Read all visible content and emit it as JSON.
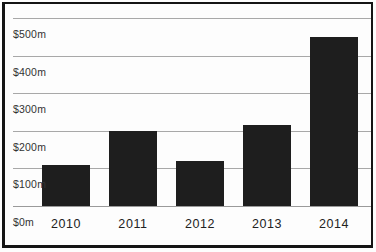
{
  "chart_data": {
    "type": "bar",
    "title": "",
    "xlabel": "",
    "ylabel": "",
    "unit": "$m (millions of dollars)",
    "categories": [
      "2010",
      "2011",
      "2012",
      "2013",
      "2014"
    ],
    "values": [
      110,
      200,
      120,
      215,
      450
    ],
    "ylim": [
      0,
      550
    ],
    "y_ticks": [
      {
        "value": 500,
        "label": "$500m"
      },
      {
        "value": 400,
        "label": "$400m"
      },
      {
        "value": 300,
        "label": "$300m"
      },
      {
        "value": 200,
        "label": "$200m"
      },
      {
        "value": 100,
        "label": "$100m"
      },
      {
        "value": 0,
        "label": "$0m"
      }
    ],
    "grid": true,
    "legend": false,
    "colors": {
      "bar": "#1e1e1e",
      "gridline": "#a8a8a8",
      "baseline": "#9a9a9a",
      "frame_border": "#141414",
      "background": "#fdfdfd",
      "tick_text": "#333333",
      "year_text": "#222222"
    }
  }
}
